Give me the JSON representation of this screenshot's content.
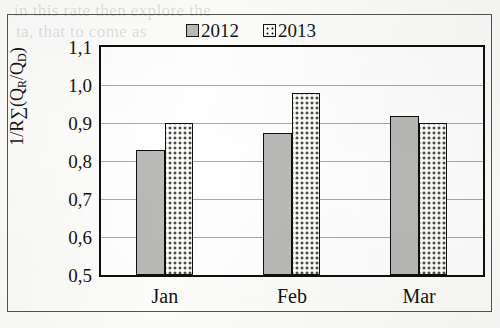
{
  "chart_data": {
    "type": "bar",
    "title": "",
    "xlabel": "",
    "ylabel": "1/R∑(QR/QD)",
    "ylabel_parts": {
      "prefix": "1/R∑(Q",
      "sub1": "R",
      "middle": "/Q",
      "sub2": "D",
      "suffix": ")"
    },
    "categories": [
      "Jan",
      "Feb",
      "Mar"
    ],
    "series": [
      {
        "name": "2012",
        "values": [
          0.83,
          0.875,
          0.92
        ],
        "color": "#b9b9b7",
        "pattern": "solid-gray"
      },
      {
        "name": "2013",
        "values": [
          0.9,
          0.98,
          0.9
        ],
        "color": "#fcfcfb",
        "pattern": "dotted"
      }
    ],
    "ylim": [
      0.5,
      1.1
    ],
    "y_ticks": [
      0.5,
      0.6,
      0.7,
      0.8,
      0.9,
      1.0,
      1.1
    ],
    "y_tick_labels": [
      "0,5",
      "0,6",
      "0,7",
      "0,8",
      "0,9",
      "1,0",
      "1,1"
    ],
    "grid": true,
    "legend_position": "top-center",
    "decimal_separator": ","
  },
  "legend": {
    "entries": [
      {
        "label": "2012",
        "swatch": "gray-square-icon"
      },
      {
        "label": "2013",
        "swatch": "dotted-square-icon"
      }
    ]
  },
  "scan_artifacts": {
    "bleed_line_1": "in this   rate   then explore the",
    "bleed_line_2": "ta,   that   to   come   as",
    "bleed_line_3": ""
  }
}
